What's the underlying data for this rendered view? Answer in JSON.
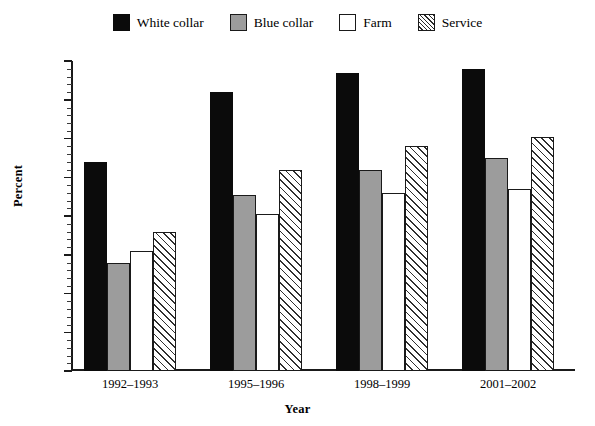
{
  "chart_data": {
    "type": "bar",
    "title": "",
    "xlabel": "Year",
    "ylabel": "Percent",
    "categories": [
      "1992–1993",
      "1995–1996",
      "1998–1999",
      "2001–2002"
    ],
    "series": [
      {
        "name": "White collar",
        "values": [
          54,
          72,
          77,
          78
        ],
        "fill": "#0b0b0b",
        "pattern": "solid-black"
      },
      {
        "name": "Blue collar",
        "values": [
          28,
          45.5,
          52,
          55
        ],
        "fill": "#9c9c9c",
        "pattern": "solid-gray"
      },
      {
        "name": "Farm",
        "values": [
          31,
          40.5,
          46,
          47
        ],
        "fill": "#ffffff",
        "pattern": "solid-white"
      },
      {
        "name": "Service",
        "values": [
          36,
          52,
          58,
          60.5
        ],
        "fill": "#ffffff",
        "pattern": "diagonal-hatch"
      }
    ],
    "ylim": [
      0,
      80
    ],
    "ytick_values": [
      0,
      10,
      20,
      30,
      40,
      50,
      60,
      70,
      80
    ],
    "ytick_labels": [
      "0",
      "10",
      "20",
      "30",
      "40",
      "50",
      "60",
      "70",
      "80"
    ],
    "yminor_step": 2,
    "grid": false,
    "legend_position": "top-center"
  },
  "legend": {
    "items": [
      {
        "label": "White collar",
        "swatch": "swatch-white-collar"
      },
      {
        "label": "Blue collar",
        "swatch": "swatch-blue-collar"
      },
      {
        "label": "Farm",
        "swatch": "swatch-farm"
      },
      {
        "label": "Service",
        "swatch": "swatch-service"
      }
    ]
  },
  "axes": {
    "y_title": "Percent",
    "x_title": "Year"
  },
  "colors": {
    "axis": "#1a1a1a",
    "white_collar": "#0b0b0b",
    "blue_collar": "#9c9c9c",
    "farm": "#ffffff",
    "service_hatch": "#2f2f2f",
    "background": "#ffffff"
  }
}
